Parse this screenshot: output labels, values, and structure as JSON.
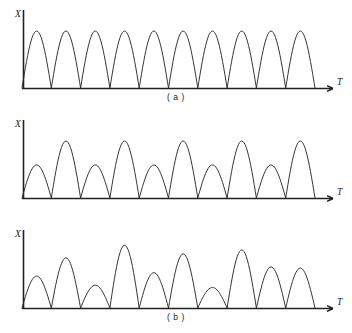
{
  "figure": {
    "background_color": "#ffffff",
    "curve_color": "#2a2a2a",
    "axis_color": "#222222"
  },
  "axes": {
    "y_label": "X",
    "x_label": "T"
  },
  "panels": [
    {
      "id": "a",
      "caption": "( a )",
      "y_label": "X",
      "x_label": "T"
    },
    {
      "id": "b",
      "caption": "( b )",
      "y_label": "X",
      "x_label": "T"
    },
    {
      "id": "c",
      "caption": "( c )",
      "y_label": "X",
      "x_label": "T"
    }
  ],
  "chart_data": [
    {
      "type": "line",
      "title": "( a )",
      "xlabel": "T",
      "ylabel": "X",
      "series": [
        {
          "name": "uniform rectified sine",
          "hump_count": 10,
          "hump_heights": [
            100,
            100,
            100,
            100,
            100,
            100,
            100,
            100,
            100,
            100
          ]
        }
      ],
      "x_start": 22,
      "hump_width": 29.3,
      "baseline_y": 88,
      "peak_y": 31,
      "xlim": [
        22,
        315
      ],
      "ylim": [
        0,
        100
      ],
      "grid": false,
      "legend": "none"
    },
    {
      "type": "line",
      "title": "( b )",
      "xlabel": "T",
      "ylabel": "X",
      "series": [
        {
          "name": "alternating amplitude rectified sine",
          "hump_count": 10,
          "hump_heights": [
            58,
            100,
            58,
            100,
            58,
            100,
            58,
            100,
            58,
            100
          ]
        }
      ],
      "x_start": 22,
      "hump_width": 29.3,
      "baseline_y": 88,
      "peak_y": 31,
      "xlim": [
        22,
        315
      ],
      "ylim": [
        0,
        100
      ],
      "grid": false,
      "legend": "none"
    },
    {
      "type": "line",
      "title": "( c )",
      "xlabel": "T",
      "ylabel": "X",
      "series": [
        {
          "name": "irregular amplitude rectified sine",
          "hump_count": 10,
          "hump_heights": [
            56,
            88,
            40,
            110,
            62,
            95,
            36,
            102,
            72,
            70
          ]
        }
      ],
      "x_start": 22,
      "hump_width": 29.3,
      "baseline_y": 88,
      "peak_y": 31,
      "xlim": [
        22,
        315
      ],
      "ylim": [
        0,
        100
      ],
      "grid": false,
      "legend": "none"
    }
  ]
}
